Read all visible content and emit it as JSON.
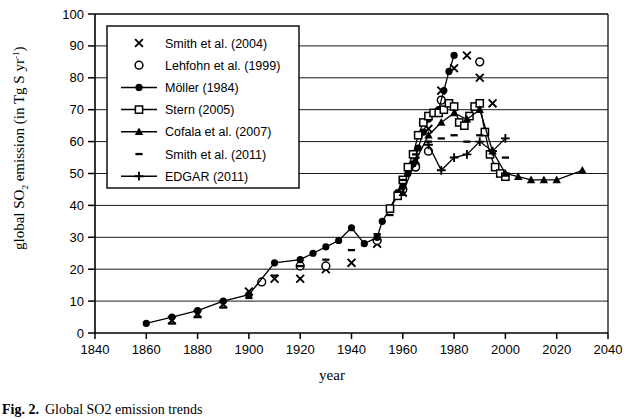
{
  "figure": {
    "caption_prefix": "Fig. 2.",
    "caption_text": "Global SO2 emission trends",
    "y_axis_title_parts": {
      "main1": "global SO",
      "sub1": "2",
      "main2": " emission (in Tg S yr",
      "sup1": "-1",
      "main3": ")"
    },
    "x_axis_title": "year"
  },
  "chart_data": {
    "type": "line",
    "title": "",
    "xlabel": "year",
    "ylabel": "global SO2 emission (in Tg S yr-1)",
    "xlim": [
      1840,
      2040
    ],
    "ylim": [
      0,
      100
    ],
    "xticks": [
      1840,
      1860,
      1880,
      1900,
      1920,
      1940,
      1960,
      1980,
      2000,
      2020,
      2040
    ],
    "yticks": [
      0,
      10,
      20,
      30,
      40,
      50,
      60,
      70,
      80,
      90,
      100
    ],
    "grid": "horizontal",
    "legend_position": "upper-left-inside",
    "series": [
      {
        "name": "Smith et al. (2004)",
        "marker": "x-cross",
        "line": false,
        "points": [
          [
            1870,
            4
          ],
          [
            1880,
            6
          ],
          [
            1890,
            9
          ],
          [
            1900,
            13
          ],
          [
            1910,
            17
          ],
          [
            1920,
            17
          ],
          [
            1930,
            20
          ],
          [
            1940,
            22
          ],
          [
            1950,
            28
          ],
          [
            1960,
            44
          ],
          [
            1965,
            54
          ],
          [
            1970,
            64
          ],
          [
            1975,
            76
          ],
          [
            1980,
            83
          ],
          [
            1985,
            87
          ],
          [
            1990,
            80
          ],
          [
            1995,
            72
          ]
        ]
      },
      {
        "name": "Lehfohn et al. (1999)",
        "marker": "open-circle",
        "line": false,
        "points": [
          [
            1905,
            16
          ],
          [
            1920,
            21
          ],
          [
            1930,
            21
          ],
          [
            1950,
            29
          ],
          [
            1960,
            45
          ],
          [
            1965,
            52
          ],
          [
            1970,
            57
          ],
          [
            1975,
            73
          ],
          [
            1990,
            85
          ]
        ]
      },
      {
        "name": "Möller (1984)",
        "marker": "filled-circle",
        "line": true,
        "points": [
          [
            1860,
            3
          ],
          [
            1870,
            5
          ],
          [
            1880,
            7
          ],
          [
            1890,
            10
          ],
          [
            1900,
            12
          ],
          [
            1910,
            22
          ],
          [
            1920,
            23
          ],
          [
            1925,
            25
          ],
          [
            1930,
            27
          ],
          [
            1935,
            29
          ],
          [
            1940,
            33
          ],
          [
            1945,
            28
          ],
          [
            1950,
            30
          ],
          [
            1952,
            35
          ],
          [
            1955,
            39
          ],
          [
            1958,
            44
          ],
          [
            1960,
            46
          ],
          [
            1962,
            50
          ],
          [
            1964,
            53
          ],
          [
            1966,
            58
          ],
          [
            1968,
            63
          ],
          [
            1970,
            67
          ],
          [
            1972,
            69
          ],
          [
            1974,
            70
          ],
          [
            1976,
            76
          ],
          [
            1978,
            82
          ],
          [
            1980,
            87
          ]
        ]
      },
      {
        "name": "Stern (2005)",
        "marker": "open-square",
        "line": true,
        "points": [
          [
            1955,
            39
          ],
          [
            1958,
            43
          ],
          [
            1960,
            48
          ],
          [
            1962,
            52
          ],
          [
            1964,
            56
          ],
          [
            1966,
            62
          ],
          [
            1968,
            66
          ],
          [
            1970,
            68
          ],
          [
            1972,
            69
          ],
          [
            1974,
            69
          ],
          [
            1976,
            70
          ],
          [
            1978,
            72
          ],
          [
            1980,
            71
          ],
          [
            1982,
            66
          ],
          [
            1984,
            65
          ],
          [
            1986,
            68
          ],
          [
            1988,
            71
          ],
          [
            1990,
            72
          ],
          [
            1992,
            63
          ],
          [
            1994,
            56
          ],
          [
            1996,
            52
          ],
          [
            1998,
            50
          ],
          [
            2000,
            49
          ]
        ]
      },
      {
        "name": "Cofala et al. (2007)",
        "marker": "filled-triangle",
        "line": true,
        "points": [
          [
            1960,
            44
          ],
          [
            1965,
            54
          ],
          [
            1970,
            62
          ],
          [
            1975,
            66
          ],
          [
            1980,
            69
          ],
          [
            1985,
            67
          ],
          [
            1990,
            70
          ],
          [
            1995,
            57
          ],
          [
            2000,
            50
          ],
          [
            2005,
            49
          ],
          [
            2010,
            48
          ],
          [
            2015,
            48
          ],
          [
            2020,
            48
          ],
          [
            2030,
            51
          ]
        ]
      },
      {
        "name": "Smith et al. (2011)",
        "marker": "short-dash",
        "line": false,
        "points": [
          [
            1870,
            3
          ],
          [
            1880,
            5
          ],
          [
            1890,
            8
          ],
          [
            1900,
            11
          ],
          [
            1910,
            18
          ],
          [
            1920,
            21
          ],
          [
            1930,
            23
          ],
          [
            1940,
            26
          ],
          [
            1950,
            31
          ],
          [
            1955,
            37
          ],
          [
            1960,
            48
          ],
          [
            1965,
            56
          ],
          [
            1970,
            60
          ],
          [
            1975,
            61
          ],
          [
            1980,
            62
          ],
          [
            1985,
            60
          ],
          [
            1990,
            62
          ],
          [
            1995,
            57
          ],
          [
            2000,
            55
          ]
        ]
      },
      {
        "name": "EDGAR (2011)",
        "marker": "plus",
        "line": true,
        "points": [
          [
            1970,
            59
          ],
          [
            1975,
            51
          ],
          [
            1980,
            55
          ],
          [
            1985,
            56
          ],
          [
            1990,
            60
          ],
          [
            1995,
            57
          ],
          [
            2000,
            61
          ]
        ]
      }
    ]
  },
  "legend": {
    "items": [
      {
        "label": "Smith et al. (2004)",
        "marker": "x-cross",
        "line": false
      },
      {
        "label": "Lehfohn et al. (1999)",
        "marker": "open-circle",
        "line": false
      },
      {
        "label": "Möller (1984)",
        "marker": "filled-circle",
        "line": true
      },
      {
        "label": "Stern (2005)",
        "marker": "open-square",
        "line": true
      },
      {
        "label": "Cofala et al. (2007)",
        "marker": "filled-triangle",
        "line": true
      },
      {
        "label": "Smith et al. (2011)",
        "marker": "short-dash",
        "line": false
      },
      {
        "label": "EDGAR (2011)",
        "marker": "plus",
        "line": true
      }
    ]
  }
}
